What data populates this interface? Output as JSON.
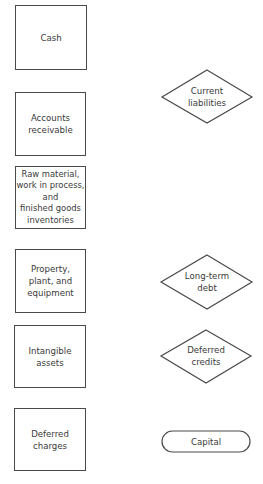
{
  "assets": [
    {
      "id": "cash",
      "label": "Cash"
    },
    {
      "id": "accounts-receivable",
      "label": "Accounts\nreceivable"
    },
    {
      "id": "inventories",
      "label": "Raw material,\nwork in process,\nand\nfinished goods\ninventories"
    },
    {
      "id": "property-plant-equipment",
      "label": "Property,\nplant, and\nequipment"
    },
    {
      "id": "intangible-assets",
      "label": "Intangible\nassets"
    },
    {
      "id": "deferred-charges",
      "label": "Deferred\ncharges"
    }
  ],
  "liabilities": [
    {
      "id": "current-liabilities",
      "label": "Current\nliabilities",
      "shape": "diamond"
    },
    {
      "id": "long-term-debt",
      "label": "Long-term\ndebt",
      "shape": "diamond"
    },
    {
      "id": "deferred-credits",
      "label": "Deferred\ncredits",
      "shape": "diamond"
    },
    {
      "id": "capital",
      "label": "Capital",
      "shape": "rounded-rectangle"
    }
  ],
  "colors": {
    "stroke": "#4a4a4a",
    "text": "#3a3a3a",
    "background": "#ffffff"
  }
}
